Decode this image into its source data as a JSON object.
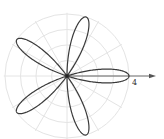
{
  "chart_data": {
    "type": "line",
    "subtype": "polar",
    "title": "",
    "equation": "r = 4 cos(5θ)",
    "petals": 5,
    "amplitude": 4,
    "petal_angles_deg": [
      0,
      72,
      144,
      216,
      288
    ],
    "polar_axis_label": "4",
    "rlim": [
      0,
      4
    ],
    "r_grid": [
      1,
      2,
      3,
      4
    ],
    "theta_grid_step_deg": 30,
    "grid": true,
    "legend": null,
    "colors": {
      "curve": "#3a3a3a",
      "grid": "#e4e4e4",
      "axis": "#555555"
    }
  }
}
